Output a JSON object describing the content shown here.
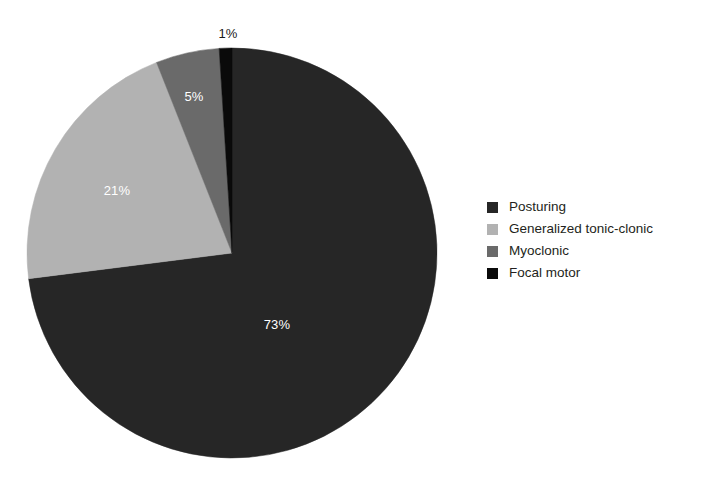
{
  "background_color": "#ffffff",
  "chart_data": {
    "type": "pie",
    "title": "",
    "subtitle": "",
    "xlabel": "",
    "ylabel": "",
    "grid": false,
    "legend_position": "right",
    "unit": "%",
    "categories": [
      "Posturing",
      "Generalized tonic-clonic",
      "Myoclonic",
      "Focal motor"
    ],
    "values": [
      73,
      21,
      5,
      1
    ],
    "labels": [
      "73%",
      "21%",
      "5%",
      "1%"
    ],
    "colors": [
      "#262626",
      "#b2b2b2",
      "#6a6a6a",
      "#0a0a0a"
    ],
    "start_angle_deg": 0,
    "direction": "clockwise",
    "slices": [
      {
        "name": "Posturing",
        "value": 73,
        "label": "73%",
        "color": "#262626",
        "label_color": "#ffffff",
        "label_placement": "inside",
        "label_x": 277,
        "label_y": 324
      },
      {
        "name": "Generalized tonic-clonic",
        "value": 21,
        "label": "21%",
        "color": "#b2b2b2",
        "label_color": "#ffffff",
        "label_placement": "inside",
        "label_x": 117,
        "label_y": 190
      },
      {
        "name": "Myoclonic",
        "value": 5,
        "label": "5%",
        "color": "#6a6a6a",
        "label_color": "#ffffff",
        "label_placement": "inside",
        "label_x": 194,
        "label_y": 96
      },
      {
        "name": "Focal motor",
        "value": 1,
        "label": "1%",
        "color": "#0a0a0a",
        "label_color": "#1a1a1a",
        "label_placement": "outside",
        "label_x": 228,
        "label_y": 33
      }
    ],
    "geometry": {
      "center_x": 232,
      "center_y": 253,
      "radius": 205
    }
  },
  "legend": {
    "items": [
      {
        "label": "Posturing",
        "color": "#262626"
      },
      {
        "label": "Generalized tonic-clonic",
        "color": "#b2b2b2"
      },
      {
        "label": "Myoclonic",
        "color": "#6a6a6a"
      },
      {
        "label": "Focal motor",
        "color": "#0a0a0a"
      }
    ]
  }
}
